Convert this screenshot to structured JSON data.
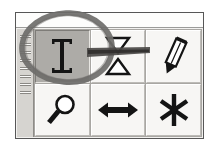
{
  "screenshot": {
    "description": "Screenshot of a small floating application toolbar with six tool buttons, annotated with a hand-drawn circle around the text tool",
    "background_color": "#ffffff",
    "width": 214,
    "height": 151
  },
  "toolbar": {
    "name": "Tools",
    "panel_color": "#f2f1ef",
    "border_color": "#575757",
    "title_band": {
      "label": "",
      "color": "#fdfdfc"
    },
    "grip": {
      "label": "Drag handle",
      "ridge_count": 8,
      "color": "#d6d4d0"
    },
    "buttons": [
      {
        "row": 1,
        "column": 1,
        "icon": "text-cursor-icon",
        "label": "Text",
        "state": "selected",
        "background_color": "#adaba7"
      },
      {
        "row": 1,
        "column": 2,
        "icon": "vertical-size-icon",
        "label": "Vertical Size",
        "state": "normal",
        "background_color": "#f7f6f4"
      },
      {
        "row": 1,
        "column": 3,
        "icon": "pencil-icon",
        "label": "Pencil",
        "state": "normal",
        "background_color": "#f7f6f4"
      },
      {
        "row": 2,
        "column": 1,
        "icon": "magnifier-icon",
        "label": "Zoom",
        "state": "normal",
        "background_color": "#f7f6f4"
      },
      {
        "row": 2,
        "column": 2,
        "icon": "horizontal-arrow-icon",
        "label": "Horizontal Size",
        "state": "normal",
        "background_color": "#f7f6f4"
      },
      {
        "row": 2,
        "column": 3,
        "icon": "asterisk-icon",
        "label": "Snap",
        "state": "normal",
        "background_color": "#f7f6f4"
      }
    ]
  },
  "annotation": {
    "type": "hand-drawn-callout",
    "shape": "ellipse",
    "target": "text-cursor-icon",
    "color": "#6e6c6a",
    "label": "",
    "has_leader_line": true
  }
}
